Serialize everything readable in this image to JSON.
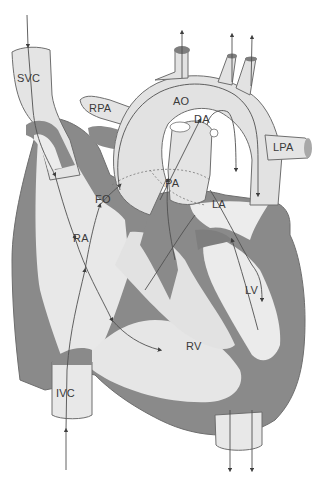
{
  "diagram": {
    "colors": {
      "background": "#ffffff",
      "vessel_fill": "#e4e4e4",
      "vessel_light": "#efefef",
      "wall": "#8a8a8a",
      "outline": "#6e6e6e",
      "arrow": "#4a4a4a",
      "label": "#3a3a3a"
    },
    "labels": {
      "svc": "SVC",
      "rpa": "RPA",
      "ao": "AO",
      "da": "DA",
      "lpa": "LPA",
      "fo": "FO",
      "pa": "PA",
      "la": "LA",
      "ra": "RA",
      "lv": "LV",
      "rv": "RV",
      "ivc": "IVC"
    }
  }
}
